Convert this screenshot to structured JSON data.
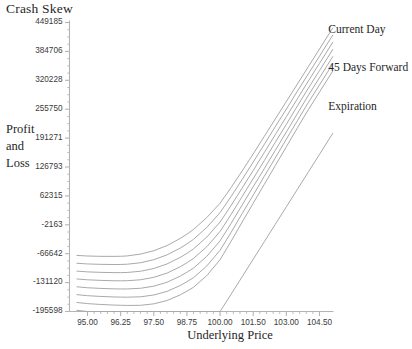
{
  "chart_data": {
    "type": "line",
    "title": "Crash Skew",
    "xlabel": "Underlying Price",
    "ylabel": "Profit and Loss",
    "ylabel_lines": [
      "Profit",
      "and",
      "Loss"
    ],
    "grid": false,
    "legend_position": "right-inline",
    "xlim": [
      94.6,
      105.1
    ],
    "ylim": [
      -195598,
      449185
    ],
    "xtick_labels": [
      "95.00",
      "96.25",
      "97.50",
      "98.75",
      "100.00",
      "101.50",
      "103.00",
      "104.50"
    ],
    "xtick_values": [
      95.0,
      96.25,
      97.5,
      98.75,
      100.0,
      101.5,
      103.0,
      104.5
    ],
    "ytick_labels": [
      "449185",
      "384706",
      "320228",
      "255750",
      "191271",
      "126793",
      "62315",
      "-2163",
      "-66642",
      "-131120",
      "-195598"
    ],
    "ytick_values": [
      449185,
      384706,
      320228,
      255750,
      191271,
      126793,
      62315,
      -2163,
      -66642,
      -131120,
      -195598
    ],
    "line_color": "#9a9a9a",
    "axis_color": "#b4b4b4",
    "annotations": [
      {
        "text": "Current Day",
        "x": 104.9,
        "y": 430000
      },
      {
        "text": "45 Days Forward",
        "x": 104.9,
        "y": 345000
      },
      {
        "text": "Expiration",
        "x": 104.9,
        "y": 258000
      }
    ],
    "x": [
      94.6,
      95.0,
      95.5,
      96.0,
      96.25,
      96.5,
      97.0,
      97.5,
      98.0,
      98.5,
      98.75,
      99.0,
      99.5,
      100.0,
      100.5,
      101.0,
      101.5,
      102.0,
      102.5,
      103.0,
      103.5,
      104.0,
      104.5,
      105.1
    ],
    "series": [
      {
        "name": "Current Day",
        "values": [
          -70500,
          -71800,
          -72500,
          -72600,
          -72400,
          -71600,
          -67500,
          -60000,
          -48500,
          -32500,
          -23000,
          -12500,
          14000,
          46000,
          81000,
          118000,
          156000,
          195000,
          234000,
          273000,
          312000,
          351000,
          390000,
          437000
        ]
      },
      {
        "name": "Day 2",
        "values": [
          -88000,
          -89500,
          -90400,
          -90800,
          -90700,
          -90100,
          -86800,
          -80000,
          -69200,
          -54000,
          -44800,
          -34500,
          -8000,
          25000,
          61000,
          99000,
          138000,
          177000,
          217000,
          256000,
          296000,
          335000,
          374000,
          421000
        ]
      },
      {
        "name": "Day 3",
        "values": [
          -105500,
          -107200,
          -108300,
          -108900,
          -108900,
          -108500,
          -105800,
          -99700,
          -89500,
          -74800,
          -65800,
          -55800,
          -29500,
          4000,
          41000,
          80000,
          119000,
          159000,
          199000,
          239000,
          279000,
          319000,
          358000,
          405000
        ]
      },
      {
        "name": "Day 4",
        "values": [
          -123000,
          -124900,
          -126200,
          -127000,
          -127100,
          -126900,
          -124800,
          -119400,
          -109900,
          -95700,
          -86900,
          -77200,
          -51000,
          -17000,
          21000,
          61000,
          101000,
          141000,
          182000,
          222000,
          263000,
          303000,
          342000,
          389000
        ]
      },
      {
        "name": "45 Days Forward",
        "values": [
          -140500,
          -142600,
          -144100,
          -145100,
          -145300,
          -145300,
          -143800,
          -139100,
          -130300,
          -116600,
          -108000,
          -98600,
          -72500,
          -38000,
          1000,
          42000,
          83000,
          123000,
          164000,
          205000,
          246000,
          287000,
          326000,
          373000
        ]
      },
      {
        "name": "Day 6",
        "values": [
          -158000,
          -160300,
          -162000,
          -163200,
          -163500,
          -163700,
          -162800,
          -158800,
          -150700,
          -137500,
          -129100,
          -120000,
          -94000,
          -59000,
          -19000,
          23000,
          64000,
          106000,
          147000,
          189000,
          230000,
          271000,
          310000,
          357000
        ]
      },
      {
        "name": "Day 7",
        "values": [
          -175500,
          -178000,
          -179900,
          -181300,
          -181700,
          -182100,
          -181800,
          -178500,
          -171100,
          -158400,
          -150200,
          -141400,
          -115500,
          -80000,
          -39000,
          4000,
          46000,
          88000,
          130000,
          172000,
          214000,
          255000,
          294000,
          341000
        ]
      },
      {
        "name": "Expiration",
        "values": [
          -193000,
          -195598,
          -195598,
          -195598,
          -195598,
          -195598,
          -195598,
          -195598,
          -195598,
          -195598,
          -195598,
          -195598,
          -195598,
          -195598,
          -157000,
          -118000,
          -79000,
          -40000,
          -1000,
          38000,
          77000,
          116000,
          155000,
          202000
        ]
      }
    ]
  }
}
